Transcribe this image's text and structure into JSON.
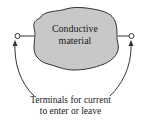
{
  "diagram": {
    "blob": {
      "label_line1": "Conductive",
      "label_line2": "material",
      "fill": "#c8c8c8",
      "stroke": "#333333"
    },
    "terminals": [
      "left-terminal",
      "right-terminal"
    ],
    "caption": {
      "line1": "Terminals for current",
      "line2": "to enter or leave"
    }
  }
}
